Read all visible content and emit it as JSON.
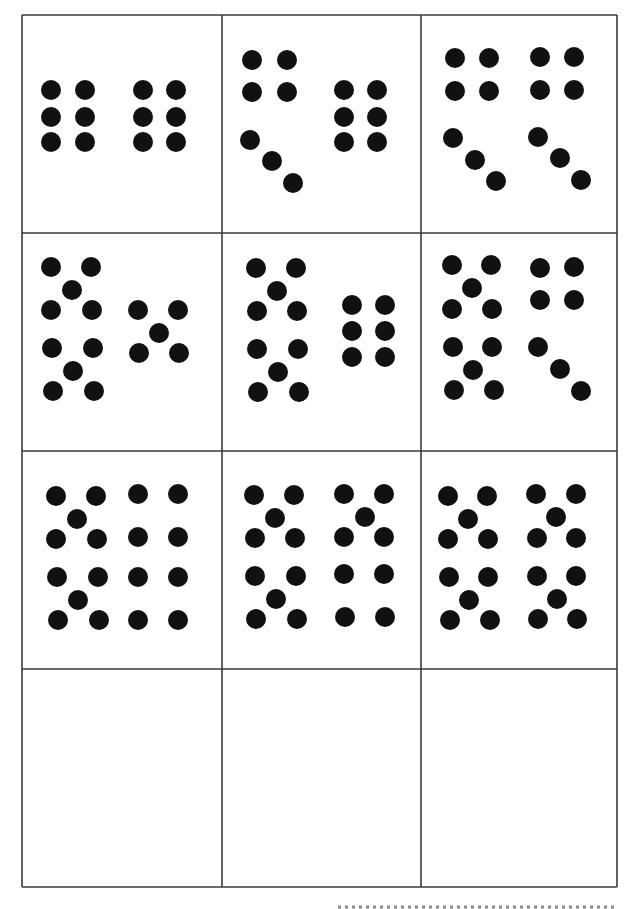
{
  "worksheet": {
    "title": "",
    "dot_radius": 10,
    "dot_color": "#111111",
    "line_color": "#3a3a3a",
    "grid": {
      "columns_x": [
        22,
        222,
        421,
        617
      ],
      "rows_y": [
        15,
        233,
        451,
        669,
        887
      ]
    },
    "cards": [
      {
        "id": "card-1",
        "row": 0,
        "col": 0,
        "total": 12,
        "groups": [
          {
            "pattern": "six-grid",
            "dots": [
              [
                51,
                90
              ],
              [
                85,
                90
              ],
              [
                51,
                117
              ],
              [
                85,
                117
              ],
              [
                51,
                142
              ],
              [
                85,
                142
              ]
            ]
          },
          {
            "pattern": "six-grid",
            "dots": [
              [
                143,
                90
              ],
              [
                176,
                90
              ],
              [
                143,
                117
              ],
              [
                176,
                117
              ],
              [
                143,
                142
              ],
              [
                176,
                142
              ]
            ]
          }
        ]
      },
      {
        "id": "card-2",
        "row": 0,
        "col": 1,
        "total": 13,
        "groups": [
          {
            "pattern": "four-square",
            "dots": [
              [
                252,
                60
              ],
              [
                287,
                60
              ],
              [
                252,
                92
              ],
              [
                287,
                92
              ]
            ]
          },
          {
            "pattern": "three-diagonal",
            "dots": [
              [
                250,
                140
              ],
              [
                272,
                161
              ],
              [
                293,
                183
              ]
            ]
          },
          {
            "pattern": "six-grid",
            "dots": [
              [
                344,
                90
              ],
              [
                377,
                90
              ],
              [
                344,
                117
              ],
              [
                377,
                117
              ],
              [
                344,
                142
              ],
              [
                377,
                142
              ]
            ]
          }
        ]
      },
      {
        "id": "card-3",
        "row": 0,
        "col": 2,
        "total": 14,
        "groups": [
          {
            "pattern": "four-square",
            "dots": [
              [
                455,
                58
              ],
              [
                489,
                58
              ],
              [
                455,
                91
              ],
              [
                489,
                91
              ]
            ]
          },
          {
            "pattern": "three-diagonal",
            "dots": [
              [
                453,
                138
              ],
              [
                475,
                160
              ],
              [
                496,
                181
              ]
            ]
          },
          {
            "pattern": "four-square",
            "dots": [
              [
                540,
                57
              ],
              [
                574,
                57
              ],
              [
                540,
                90
              ],
              [
                574,
                90
              ]
            ]
          },
          {
            "pattern": "three-diagonal",
            "dots": [
              [
                538,
                137
              ],
              [
                560,
                158
              ],
              [
                581,
                180
              ]
            ]
          }
        ]
      },
      {
        "id": "card-4",
        "row": 1,
        "col": 0,
        "total": 15,
        "groups": [
          {
            "pattern": "five-quincunx",
            "dots": [
              [
                51,
                267
              ],
              [
                91,
                267
              ],
              [
                72,
                290
              ],
              [
                51,
                310
              ],
              [
                92,
                310
              ]
            ]
          },
          {
            "pattern": "five-quincunx",
            "dots": [
              [
                52,
                348
              ],
              [
                93,
                348
              ],
              [
                73,
                371
              ],
              [
                53,
                391
              ],
              [
                94,
                391
              ]
            ]
          },
          {
            "pattern": "five-quincunx",
            "dots": [
              [
                138,
                310
              ],
              [
                178,
                310
              ],
              [
                159,
                333
              ],
              [
                139,
                353
              ],
              [
                179,
                353
              ]
            ]
          }
        ]
      },
      {
        "id": "card-5",
        "row": 1,
        "col": 1,
        "total": 16,
        "groups": [
          {
            "pattern": "five-quincunx",
            "dots": [
              [
                256,
                268
              ],
              [
                296,
                268
              ],
              [
                277,
                291
              ],
              [
                257,
                311
              ],
              [
                297,
                311
              ]
            ]
          },
          {
            "pattern": "five-quincunx",
            "dots": [
              [
                257,
                349
              ],
              [
                298,
                349
              ],
              [
                278,
                372
              ],
              [
                258,
                392
              ],
              [
                299,
                392
              ]
            ]
          },
          {
            "pattern": "six-grid",
            "dots": [
              [
                352,
                305
              ],
              [
                385,
                305
              ],
              [
                352,
                331
              ],
              [
                385,
                331
              ],
              [
                352,
                357
              ],
              [
                385,
                357
              ]
            ]
          }
        ]
      },
      {
        "id": "card-6",
        "row": 1,
        "col": 2,
        "total": 17,
        "groups": [
          {
            "pattern": "five-quincunx",
            "dots": [
              [
                452,
                265
              ],
              [
                491,
                265
              ],
              [
                472,
                288
              ],
              [
                452,
                309
              ],
              [
                492,
                309
              ]
            ]
          },
          {
            "pattern": "five-quincunx",
            "dots": [
              [
                453,
                347
              ],
              [
                492,
                347
              ],
              [
                473,
                370
              ],
              [
                454,
                390
              ],
              [
                494,
                390
              ]
            ]
          },
          {
            "pattern": "four-square",
            "dots": [
              [
                540,
                268
              ],
              [
                574,
                267
              ],
              [
                540,
                300
              ],
              [
                574,
                300
              ]
            ]
          },
          {
            "pattern": "three-diagonal",
            "dots": [
              [
                538,
                347
              ],
              [
                560,
                369
              ],
              [
                581,
                391
              ]
            ]
          }
        ]
      },
      {
        "id": "card-7",
        "row": 2,
        "col": 0,
        "total": 18,
        "groups": [
          {
            "pattern": "five-quincunx",
            "dots": [
              [
                56,
                496
              ],
              [
                96,
                496
              ],
              [
                77,
                519
              ],
              [
                56,
                539
              ],
              [
                97,
                539
              ]
            ]
          },
          {
            "pattern": "five-quincunx",
            "dots": [
              [
                57,
                577
              ],
              [
                98,
                577
              ],
              [
                78,
                600
              ],
              [
                58,
                620
              ],
              [
                99,
                620
              ]
            ]
          },
          {
            "pattern": "eight-grid",
            "dots": [
              [
                138,
                494
              ],
              [
                178,
                494
              ],
              [
                138,
                537
              ],
              [
                178,
                537
              ],
              [
                138,
                577
              ],
              [
                178,
                577
              ],
              [
                138,
                620
              ],
              [
                178,
                620
              ]
            ]
          }
        ]
      },
      {
        "id": "card-8",
        "row": 2,
        "col": 1,
        "total": 19,
        "groups": [
          {
            "pattern": "five-quincunx",
            "dots": [
              [
                254,
                495
              ],
              [
                294,
                495
              ],
              [
                275,
                518
              ],
              [
                255,
                538
              ],
              [
                295,
                538
              ]
            ]
          },
          {
            "pattern": "five-quincunx",
            "dots": [
              [
                255,
                576
              ],
              [
                296,
                576
              ],
              [
                276,
                599
              ],
              [
                256,
                619
              ],
              [
                297,
                619
              ]
            ]
          },
          {
            "pattern": "five-quincunx",
            "dots": [
              [
                344,
                494
              ],
              [
                384,
                494
              ],
              [
                365,
                517
              ],
              [
                344,
                537
              ],
              [
                384,
                537
              ]
            ]
          },
          {
            "pattern": "four-square",
            "dots": [
              [
                344,
                574
              ],
              [
                384,
                574
              ],
              [
                345,
                617
              ],
              [
                385,
                617
              ]
            ]
          }
        ]
      },
      {
        "id": "card-9",
        "row": 2,
        "col": 2,
        "total": 20,
        "groups": [
          {
            "pattern": "five-quincunx",
            "dots": [
              [
                448,
                496
              ],
              [
                487,
                496
              ],
              [
                468,
                519
              ],
              [
                448,
                539
              ],
              [
                488,
                539
              ]
            ]
          },
          {
            "pattern": "five-quincunx",
            "dots": [
              [
                449,
                577
              ],
              [
                488,
                577
              ],
              [
                469,
                600
              ],
              [
                450,
                620
              ],
              [
                490,
                620
              ]
            ]
          },
          {
            "pattern": "five-quincunx",
            "dots": [
              [
                536,
                494
              ],
              [
                576,
                494
              ],
              [
                556,
                517
              ],
              [
                537,
                538
              ],
              [
                576,
                538
              ]
            ]
          },
          {
            "pattern": "five-quincunx",
            "dots": [
              [
                537,
                576
              ],
              [
                576,
                576
              ],
              [
                557,
                599
              ],
              [
                538,
                619
              ],
              [
                577,
                619
              ]
            ]
          }
        ]
      },
      {
        "id": "card-10",
        "row": 3,
        "col": 0,
        "total": 0,
        "groups": []
      },
      {
        "id": "card-11",
        "row": 3,
        "col": 1,
        "total": 0,
        "groups": []
      },
      {
        "id": "card-12",
        "row": 3,
        "col": 2,
        "total": 0,
        "groups": []
      }
    ],
    "cut_line": {
      "x1": 338,
      "x2": 617,
      "y": 907
    }
  }
}
